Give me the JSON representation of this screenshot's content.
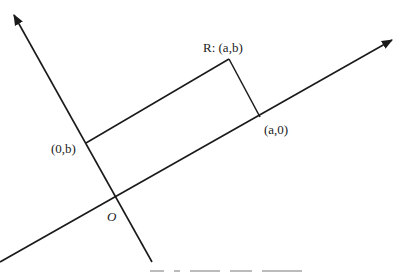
{
  "diagram": {
    "type": "rotated coordinate axes with rectangle",
    "labels": {
      "point_R": "R: (a,b)",
      "point_a0": "(a,0)",
      "point_0b": "(0,b)",
      "origin": "O"
    },
    "caption_visible": false,
    "stroke_color": "#1a1a1a",
    "background": "#ffffff"
  }
}
